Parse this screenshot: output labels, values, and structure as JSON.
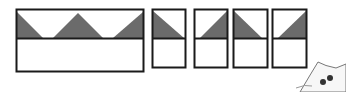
{
  "diagram": {
    "colors": {
      "stroke": "#1a1a1a",
      "shade": "#6b6b6b",
      "fill": "#ffffff"
    },
    "shapes": [
      {
        "name": "wide-rectangle",
        "x": 16,
        "y": 9,
        "w": 128,
        "h": 63,
        "divider_y": 38
      },
      {
        "name": "small-rect-1",
        "x": 152,
        "y": 9,
        "w": 34,
        "h": 59,
        "triangle": "top-left-down"
      },
      {
        "name": "small-rect-2",
        "x": 194,
        "y": 9,
        "w": 34,
        "h": 59,
        "triangle": "bottom-right-up"
      },
      {
        "name": "small-rect-3",
        "x": 233,
        "y": 9,
        "w": 35,
        "h": 59,
        "triangle": "top-left-down"
      },
      {
        "name": "small-rect-4",
        "x": 272,
        "y": 9,
        "w": 35,
        "h": 59,
        "triangle": "bottom-right-up"
      }
    ]
  }
}
